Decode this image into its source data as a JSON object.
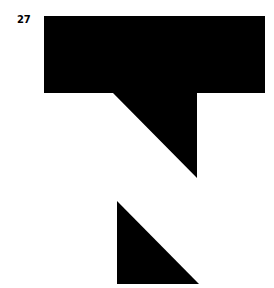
{
  "page_number": "27",
  "figure": {
    "fill_color": "#000000",
    "background_color": "#ffffff",
    "shapes": [
      {
        "name": "upper-shape",
        "points": "44,16 265,16 265,93 197,93 197,178 113,93 44,93"
      },
      {
        "name": "lower-triangle",
        "points": "117,201 199,284 117,284"
      }
    ]
  }
}
